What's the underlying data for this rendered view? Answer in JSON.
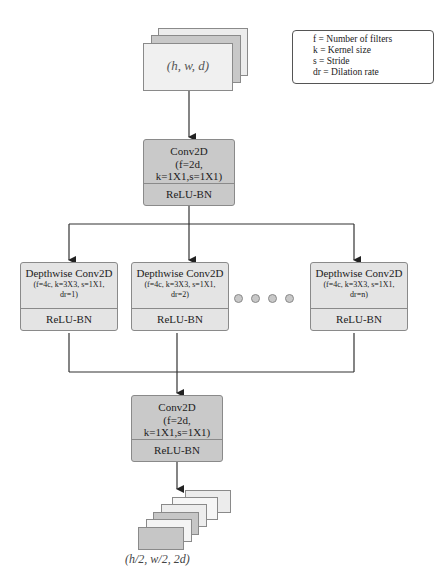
{
  "legend": {
    "lines": [
      "f = Number of filters",
      "k = Kernel size",
      "s = Stride",
      "dr = Dilation rate"
    ]
  },
  "input": {
    "label": "(h, w, d)"
  },
  "conv_top": {
    "title": "Conv2D",
    "params_line1": "(f=2d,",
    "params_line2": "k=1X1,s=1X1)",
    "activation": "ReLU-BN"
  },
  "depthwise": [
    {
      "title": "Depthwise Conv2D",
      "params_line1": "(f=4c, k=3X3, s=1X1,",
      "params_line2": "dr=1)",
      "activation": "ReLU-BN"
    },
    {
      "title": "Depthwise Conv2D",
      "params_line1": "(f=4c, k=3X3, s=1X1,",
      "params_line2": "dr=2)",
      "activation": "ReLU-BN"
    },
    {
      "title": "Depthwise Conv2D",
      "params_line1": "(f=4c, k=3X3, s=1X1,",
      "params_line2": "dr=n)",
      "activation": "ReLU-BN"
    }
  ],
  "ellipsis_dots": 4,
  "conv_bottom": {
    "title": "Conv2D",
    "params_line1": "(f=2d,",
    "params_line2": "k=1X1,s=1X1)",
    "activation": "ReLU-BN"
  },
  "output": {
    "label": "(h/2, w/2, 2d)"
  },
  "colors": {
    "conv_fill": "#c9c9c9",
    "depthwise_fill": "#e4e4e4",
    "line": "#333333"
  }
}
